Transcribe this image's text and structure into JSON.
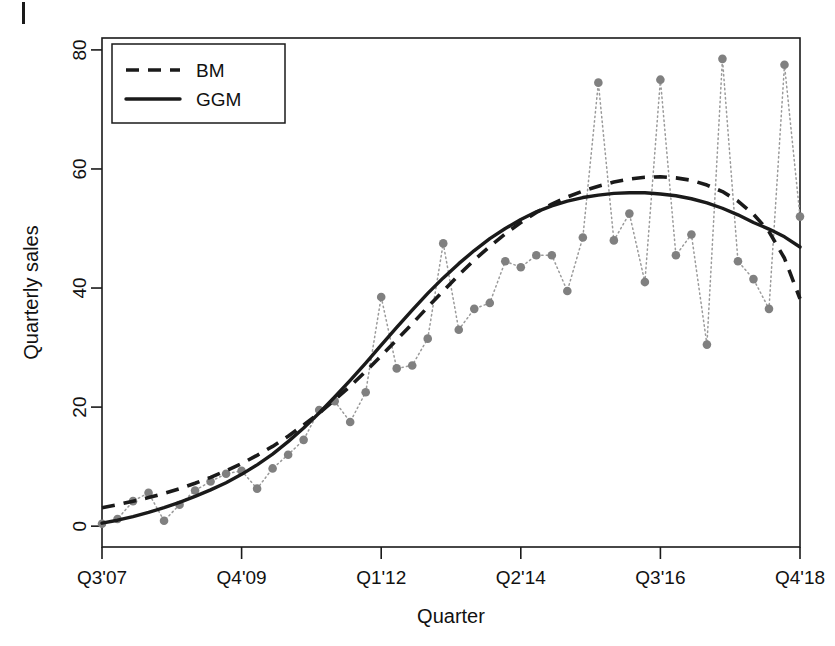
{
  "figure": {
    "corner_mark": "page-margin-tick"
  },
  "chart_data": {
    "type": "line",
    "title": "",
    "xlabel": "Quarter",
    "ylabel": "Quarterly sales",
    "xlim": [
      0,
      45
    ],
    "ylim": [
      -3.5,
      82
    ],
    "grid": false,
    "legend_position": "top-left",
    "x_tick_positions": [
      0,
      9,
      18,
      27,
      36,
      45
    ],
    "x_tick_labels": [
      "Q3'07",
      "Q4'09",
      "Q1'12",
      "Q2'14",
      "Q3'16",
      "Q4'18"
    ],
    "y_ticks": [
      0,
      20,
      40,
      60,
      80
    ],
    "y_tick_labels": [
      "0",
      "20",
      "40",
      "60",
      "80"
    ],
    "legend": [
      {
        "name": "BM",
        "style": "dashed"
      },
      {
        "name": "GGM",
        "style": "solid"
      }
    ],
    "series": [
      {
        "name": "Observed",
        "style": "dotted-points",
        "color": "#808080",
        "x": [
          0,
          1,
          2,
          3,
          4,
          5,
          6,
          7,
          8,
          9,
          10,
          11,
          12,
          13,
          14,
          15,
          16,
          17,
          18,
          19,
          20,
          21,
          22,
          23,
          24,
          25,
          26,
          27,
          28,
          29,
          30,
          31,
          32,
          33,
          34,
          35,
          36,
          37,
          38,
          39,
          40,
          41,
          42,
          43,
          44,
          45
        ],
        "values": [
          0.4,
          1.2,
          4.2,
          5.6,
          0.9,
          3.6,
          6.0,
          7.5,
          8.8,
          9.3,
          6.3,
          9.7,
          12.0,
          14.5,
          19.5,
          21.0,
          17.5,
          22.5,
          38.5,
          26.5,
          27.0,
          31.5,
          47.5,
          33.0,
          36.5,
          37.5,
          44.5,
          43.5,
          45.5,
          45.5,
          39.5,
          48.5,
          74.5,
          48.0,
          52.5,
          41.0,
          75.0,
          45.5,
          49.0,
          30.5,
          78.5,
          44.5,
          41.5,
          36.5,
          77.5,
          52.0
        ]
      },
      {
        "name": "BM",
        "style": "dashed",
        "color": "#1a1a1a",
        "x": [
          0,
          1,
          2,
          3,
          4,
          5,
          6,
          7,
          8,
          9,
          10,
          11,
          12,
          13,
          14,
          15,
          16,
          17,
          18,
          19,
          20,
          21,
          22,
          23,
          24,
          25,
          26,
          27,
          28,
          29,
          30,
          31,
          32,
          33,
          34,
          35,
          36,
          37,
          38,
          39,
          40,
          41,
          42,
          43,
          44,
          45
        ],
        "values": [
          3.1,
          3.6,
          4.2,
          4.8,
          5.5,
          6.3,
          7.2,
          8.2,
          9.3,
          10.5,
          11.9,
          13.4,
          15.1,
          17.0,
          19.0,
          21.2,
          23.5,
          26.0,
          28.6,
          31.3,
          34.0,
          36.8,
          39.5,
          42.2,
          44.7,
          47.0,
          49.1,
          51.0,
          52.7,
          54.1,
          55.3,
          56.3,
          57.1,
          57.8,
          58.3,
          58.6,
          58.7,
          58.5,
          58.1,
          57.3,
          56.2,
          54.6,
          52.4,
          49.5,
          45.0,
          38.2
        ]
      },
      {
        "name": "GGM",
        "style": "solid",
        "color": "#1a1a1a",
        "x": [
          0,
          1,
          2,
          3,
          4,
          5,
          6,
          7,
          8,
          9,
          10,
          11,
          12,
          13,
          14,
          15,
          16,
          17,
          18,
          19,
          20,
          21,
          22,
          23,
          24,
          25,
          26,
          27,
          28,
          29,
          30,
          31,
          32,
          33,
          34,
          35,
          36,
          37,
          38,
          39,
          40,
          41,
          42,
          43,
          44,
          45
        ],
        "values": [
          0.5,
          1.0,
          1.6,
          2.3,
          3.1,
          4.0,
          5.0,
          6.1,
          7.3,
          8.7,
          10.3,
          12.1,
          14.2,
          16.5,
          19.0,
          21.7,
          24.5,
          27.4,
          30.4,
          33.4,
          36.3,
          39.1,
          41.7,
          44.1,
          46.3,
          48.3,
          50.0,
          51.5,
          52.8,
          53.8,
          54.6,
          55.2,
          55.6,
          55.9,
          56.0,
          56.0,
          55.8,
          55.5,
          55.0,
          54.3,
          53.4,
          52.3,
          51.0,
          49.9,
          48.6,
          46.9
        ]
      }
    ]
  }
}
